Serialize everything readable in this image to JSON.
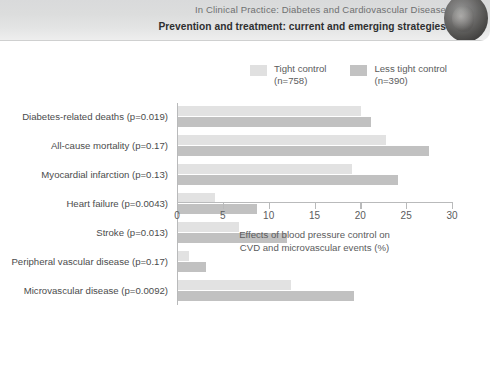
{
  "header": {
    "line1": "In Clinical Practice: Diabetes and Cardiovascular Disease",
    "line2": "Prevention and treatment: current and emerging strategies",
    "emblem_icon": "circular-photo-emblem"
  },
  "legend": {
    "position": "top-right",
    "items": [
      {
        "label_line1": "Tight control",
        "label_line2": "(n=758)",
        "color": "#e2e2e2",
        "swatch_icon": "legend-swatch-icon"
      },
      {
        "label_line1": "Less tight control",
        "label_line2": "(n=390)",
        "color": "#c1c1c1",
        "swatch_icon": "legend-swatch-icon"
      }
    ]
  },
  "chart_data": {
    "type": "bar",
    "orientation": "horizontal",
    "title": "",
    "xlabel_line1": "Effects of blood pressure control on",
    "xlabel_line2": "CVD and microvascular events (%)",
    "ylabel": "",
    "xlim": [
      0,
      30
    ],
    "xticks": [
      0,
      5,
      10,
      15,
      20,
      25,
      30
    ],
    "xtick_labels": [
      "0",
      "5",
      "10",
      "15",
      "20",
      "25",
      "30"
    ],
    "grid": false,
    "categories": [
      "Diabetes-related deaths (p=0.019)",
      "All-cause mortality (p=0.17)",
      "Myocardial infarction (p=0.13)",
      "Heart failure (p=0.0043)",
      "Stroke (p=0.013)",
      "Peripheral vascular disease (p=0.17)",
      "Microvascular disease (p=0.0092)"
    ],
    "series": [
      {
        "name": "Tight control (n=758)",
        "color": "#e2e2e2",
        "values": [
          20.0,
          22.7,
          19.0,
          4.0,
          6.6,
          1.2,
          12.3
        ]
      },
      {
        "name": "Less tight control (n=390)",
        "color": "#c1c1c1",
        "values": [
          21.0,
          27.4,
          24.0,
          8.6,
          11.9,
          3.0,
          19.2
        ]
      }
    ]
  }
}
